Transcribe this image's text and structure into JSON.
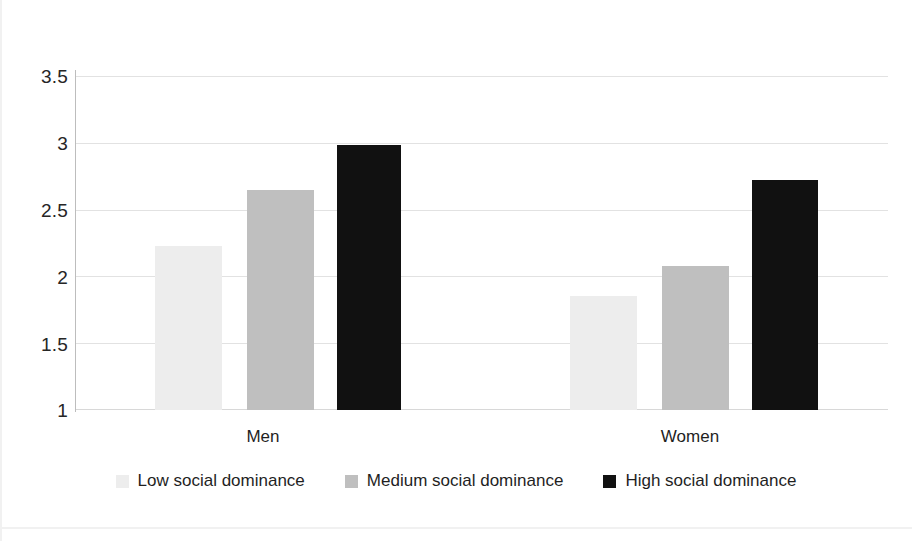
{
  "chart_data": {
    "type": "bar",
    "title": "",
    "subtitle": "",
    "xlabel": "",
    "ylabel": "",
    "categories": [
      "Men",
      "Women"
    ],
    "series": [
      {
        "name": "Low social dominance",
        "color": "#ededed",
        "values": [
          2.23,
          1.85
        ]
      },
      {
        "name": "Medium social dominance",
        "color": "#bfbfbf",
        "values": [
          2.65,
          2.08
        ]
      },
      {
        "name": "High social dominance",
        "color": "#111111",
        "values": [
          2.98,
          2.72
        ]
      }
    ],
    "ylim": [
      1,
      3.5
    ],
    "yticks": [
      1,
      1.5,
      2,
      2.5,
      3,
      3.5
    ],
    "ytick_labels": [
      "1",
      "1.5",
      "2",
      "2.5",
      "3",
      "3.5"
    ],
    "grid": true,
    "grid_axis": "y",
    "legend_position": "bottom",
    "annotations": []
  },
  "axis": {
    "y": {
      "ticks": [
        {
          "value": 3.5,
          "label": "3.5"
        },
        {
          "value": 3,
          "label": "3"
        },
        {
          "value": 2.5,
          "label": "2.5"
        },
        {
          "value": 2,
          "label": "2"
        },
        {
          "value": 1.5,
          "label": "1.5"
        },
        {
          "value": 1,
          "label": "1"
        }
      ]
    },
    "x": {
      "categories": [
        {
          "label": "Men"
        },
        {
          "label": "Women"
        }
      ]
    }
  },
  "legend": {
    "items": [
      {
        "label": "Low social dominance",
        "swatch": "low"
      },
      {
        "label": "Medium social dominance",
        "swatch": "medium"
      },
      {
        "label": "High social dominance",
        "swatch": "high"
      }
    ]
  }
}
